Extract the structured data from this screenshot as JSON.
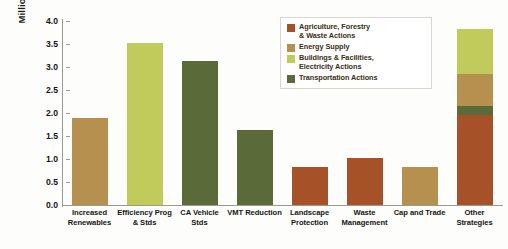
{
  "chart_data": {
    "type": "bar",
    "title": "",
    "subtitle": "",
    "xlabel": "",
    "ylabel": "Million Metric Tons CO2e",
    "ylabel_parts": {
      "prefix": "Million Metric Tons CO",
      "subscript": "2",
      "suffix": "e"
    },
    "ylim": [
      0.0,
      4.0
    ],
    "yticks": [
      "0.0",
      "0.5",
      "1.0",
      "1.5",
      "2.0",
      "2.5",
      "3.0",
      "3.5",
      "4.0"
    ],
    "ytick_values": [
      0.0,
      0.5,
      1.0,
      1.5,
      2.0,
      2.5,
      3.0,
      3.5,
      4.0
    ],
    "grid": false,
    "legend_position": "top-right",
    "stacked": true,
    "categories": [
      "Increased Renewables",
      "Efficiency Prog & Stds",
      "CA Vehicle Stds",
      "VMT Reduction",
      "Landscape Protection",
      "Waste Management",
      "Cap and Trade",
      "Other Strategies"
    ],
    "category_lines": [
      [
        "Increased",
        "Renewables"
      ],
      [
        "Efficiency Prog",
        "& Stds"
      ],
      [
        "CA Vehicle",
        "Stds"
      ],
      [
        "VMT Reduction",
        ""
      ],
      [
        "Landscape",
        "Protection"
      ],
      [
        "Waste",
        "Management"
      ],
      [
        "Cap and Trade",
        ""
      ],
      [
        "Other",
        "Strategies"
      ]
    ],
    "totals": [
      1.9,
      3.52,
      3.13,
      1.63,
      0.83,
      1.02,
      0.83,
      3.83
    ],
    "series": [
      {
        "name": "Agriculture, Forestry & Waste Actions",
        "color": "#a65128",
        "values": [
          0,
          0,
          0,
          0,
          0.83,
          1.02,
          0,
          1.95
        ]
      },
      {
        "name": "Energy Supply",
        "color": "#b5904f",
        "values": [
          1.9,
          0,
          0,
          0,
          0,
          0,
          0.83,
          0.7
        ]
      },
      {
        "name": "Buildings & Facilities, Electricity Actions",
        "color": "#c0cb5c",
        "values": [
          0,
          3.52,
          0,
          0,
          0,
          0,
          0,
          0.98
        ]
      },
      {
        "name": "Transportation Actions",
        "color": "#5a6a38",
        "values": [
          0,
          0,
          3.13,
          1.63,
          0,
          0,
          0,
          0.2
        ]
      }
    ],
    "bars": [
      {
        "category": "Increased Renewables",
        "total": 1.9,
        "segments": [
          {
            "series": "Energy Supply",
            "value": 1.9,
            "color": "#b5904f"
          }
        ]
      },
      {
        "category": "Efficiency Prog & Stds",
        "total": 3.52,
        "segments": [
          {
            "series": "Buildings & Facilities, Electricity Actions",
            "value": 3.52,
            "color": "#c0cb5c"
          }
        ]
      },
      {
        "category": "CA Vehicle Stds",
        "total": 3.13,
        "segments": [
          {
            "series": "Transportation Actions",
            "value": 3.13,
            "color": "#5a6a38"
          }
        ]
      },
      {
        "category": "VMT Reduction",
        "total": 1.63,
        "segments": [
          {
            "series": "Transportation Actions",
            "value": 1.63,
            "color": "#5a6a38"
          }
        ]
      },
      {
        "category": "Landscape Protection",
        "total": 0.83,
        "segments": [
          {
            "series": "Agriculture, Forestry & Waste Actions",
            "value": 0.83,
            "color": "#a65128"
          }
        ]
      },
      {
        "category": "Waste Management",
        "total": 1.02,
        "segments": [
          {
            "series": "Agriculture, Forestry & Waste Actions",
            "value": 1.02,
            "color": "#a65128"
          }
        ]
      },
      {
        "category": "Cap and Trade",
        "total": 0.83,
        "segments": [
          {
            "series": "Energy Supply",
            "value": 0.83,
            "color": "#b5904f"
          }
        ]
      },
      {
        "category": "Other Strategies",
        "total": 3.83,
        "segments": [
          {
            "series": "Agriculture, Forestry & Waste Actions",
            "value": 1.95,
            "color": "#a65128"
          },
          {
            "series": "Transportation Actions",
            "value": 0.2,
            "color": "#5a6a38"
          },
          {
            "series": "Energy Supply",
            "value": 0.7,
            "color": "#b5904f"
          },
          {
            "series": "Buildings & Facilities, Electricity Actions",
            "value": 0.98,
            "color": "#c0cb5c"
          }
        ]
      }
    ]
  },
  "legend": {
    "items": [
      {
        "label": "Agriculture, Forestry & Waste Actions",
        "lines": [
          "Agriculture, Forestry",
          "& Waste Actions"
        ],
        "color": "#a65128"
      },
      {
        "label": "Energy Supply",
        "lines": [
          "Energy Supply",
          ""
        ],
        "color": "#b5904f"
      },
      {
        "label": "Buildings & Facilities, Electricity Actions",
        "lines": [
          "Buildings & Facilities,",
          "Electricity Actions"
        ],
        "color": "#c0cb5c"
      },
      {
        "label": "Transportation Actions",
        "lines": [
          "Transportation Actions",
          ""
        ],
        "color": "#5a6a38"
      }
    ]
  },
  "colors": {
    "agriculture": "#a65128",
    "energy_supply": "#b5904f",
    "buildings": "#c0cb5c",
    "transportation": "#5a6a38",
    "axis": "#9a9a92",
    "text": "#141414",
    "background": "#fdfdfb"
  }
}
